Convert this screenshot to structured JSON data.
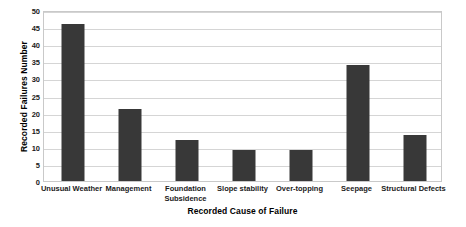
{
  "chart_data": {
    "type": "bar",
    "title": "",
    "xlabel": "Recorded Cause of Failure",
    "ylabel": "Recorded Failures Number",
    "categories": [
      "Unusual Weather",
      "Management",
      "Foundation\nSubsidence",
      "Slope stability",
      "Over-topping",
      "Seepage",
      "Structural Defects"
    ],
    "values": [
      46,
      21,
      12,
      9,
      9,
      34,
      13.5
    ],
    "ylim": [
      0,
      50
    ],
    "yticks": [
      0,
      5,
      10,
      15,
      20,
      25,
      30,
      35,
      40,
      45,
      50
    ],
    "ytick_labels": [
      "0",
      "5",
      "10",
      "15",
      "20",
      "25",
      "30",
      "35",
      "40",
      "45",
      "50"
    ],
    "grid": "horizontal",
    "legend": "none",
    "bar_color": "#383838",
    "gridline_color": "#d5d5d5",
    "plot_border_color": "#c9c9c9",
    "background_color": "#ffffff"
  }
}
